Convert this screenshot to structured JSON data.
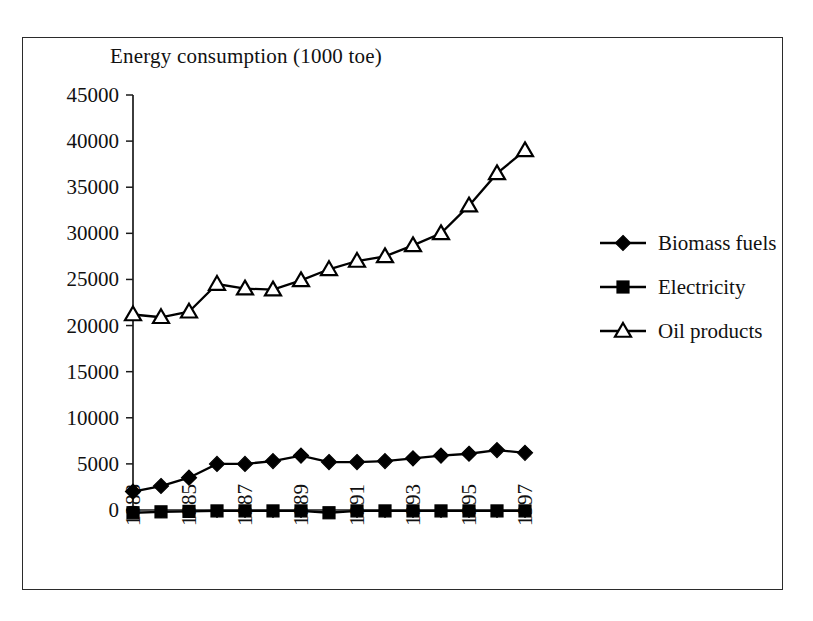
{
  "figure": {
    "title": "Energy consumption (1000 toe)",
    "frame_color": "#2b2b2b",
    "background": "#ffffff"
  },
  "legend": {
    "position": "right",
    "items": [
      {
        "label": "Biomass fuels",
        "marker": "filled-diamond",
        "color": "#000000"
      },
      {
        "label": "Electricity",
        "marker": "filled-square",
        "color": "#000000"
      },
      {
        "label": "Oil products",
        "marker": "open-triangle",
        "color": "#000000"
      }
    ]
  },
  "axes": {
    "y_ticks": [
      "0",
      "5000",
      "10000",
      "15000",
      "20000",
      "25000",
      "30000",
      "35000",
      "40000",
      "45000"
    ],
    "x_ticks_visible": [
      "1983",
      "1985",
      "1987",
      "1989",
      "1991",
      "1993",
      "1995",
      "1997"
    ],
    "x_labels_all": [
      "1983",
      "1984",
      "1985",
      "1986",
      "1987",
      "1988",
      "1989",
      "1990",
      "1991",
      "1992",
      "1993",
      "1994",
      "1995",
      "1996",
      "1997"
    ],
    "x_label_rotation": "-90",
    "grid": "off"
  },
  "chart_data": {
    "type": "line",
    "title": "Energy consumption (1000 toe)",
    "xlabel": "",
    "ylabel": "Energy consumption (1000 toe)",
    "ylim": [
      0,
      45000
    ],
    "ytick_step": 5000,
    "grid": false,
    "legend_position": "right",
    "x": [
      1983,
      1984,
      1985,
      1986,
      1987,
      1988,
      1989,
      1990,
      1991,
      1992,
      1993,
      1994,
      1995,
      1996,
      1997
    ],
    "categories": [
      "1983",
      "1984",
      "1985",
      "1986",
      "1987",
      "1988",
      "1989",
      "1990",
      "1991",
      "1992",
      "1993",
      "1994",
      "1995",
      "1996",
      "1997"
    ],
    "series": [
      {
        "name": "Biomass fuels",
        "marker": "filled-diamond",
        "color": "#000000",
        "values": [
          2000,
          2600,
          3500,
          5000,
          5000,
          5300,
          5900,
          5200,
          5200,
          5300,
          5600,
          5900,
          6100,
          6500,
          6200
        ]
      },
      {
        "name": "Electricity",
        "marker": "filled-square",
        "color": "#000000",
        "values": [
          -300,
          -200,
          -150,
          -100,
          -100,
          -100,
          -100,
          -300,
          -100,
          -100,
          -100,
          -100,
          -100,
          -100,
          -100
        ]
      },
      {
        "name": "Oil products",
        "marker": "open-triangle",
        "color": "#000000",
        "values": [
          21200,
          20900,
          21500,
          24500,
          24000,
          23900,
          24900,
          26100,
          27000,
          27500,
          28700,
          30000,
          33000,
          36500,
          39000
        ]
      }
    ]
  }
}
